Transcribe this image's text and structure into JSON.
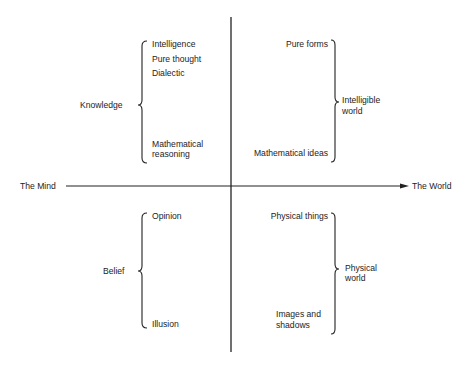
{
  "axes": {
    "horizontal": {
      "left_label": "The Mind",
      "right_label": "The World"
    }
  },
  "quadrants": {
    "top_left": {
      "group_label": "Knowledge",
      "items": [
        "Intelligence",
        "Pure thought",
        "Dialectic",
        "Mathematical",
        "reasoning"
      ]
    },
    "top_right": {
      "group_label_line1": "Intelligible",
      "group_label_line2": "world",
      "items": [
        "Pure forms",
        "Mathematical ideas"
      ]
    },
    "bottom_left": {
      "group_label": "Belief",
      "items": [
        "Opinion",
        "Illusion"
      ]
    },
    "bottom_right": {
      "group_label_line1": "Physical",
      "group_label_line2": "world",
      "items": [
        "Physical things",
        "Images and",
        "shadows"
      ]
    }
  },
  "colors": {
    "ink": "#1c1c1c",
    "background": "#ffffff"
  }
}
